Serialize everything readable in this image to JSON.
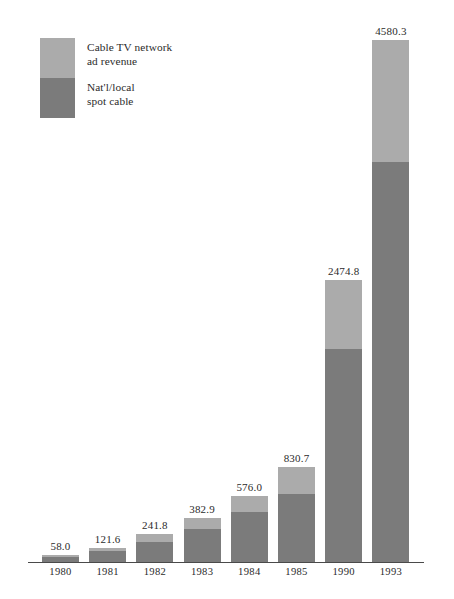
{
  "chart_data": {
    "type": "bar",
    "subtype": "stacked-bar",
    "title": "",
    "xlabel": "",
    "ylabel": "",
    "grid": false,
    "axis_visible": {
      "x": true,
      "y": false
    },
    "ylim": [
      0,
      4580.3
    ],
    "categories": [
      "1980",
      "1981",
      "1982",
      "1983",
      "1984",
      "1985",
      "1990",
      "1993"
    ],
    "series": [
      {
        "name": "Nat'l/local\nspot cable",
        "color": "#7b7b7b",
        "values": [
          47.0,
          95.0,
          180.0,
          288.0,
          435.0,
          600.0,
          1870.0,
          3510.0
        ]
      },
      {
        "name": "Cable TV network\nad revenue",
        "color": "#ababab",
        "values": [
          11.0,
          26.6,
          61.8,
          94.9,
          141.0,
          230.7,
          604.8,
          1070.3
        ]
      }
    ],
    "totals": [
      58.0,
      121.6,
      241.8,
      382.9,
      576.0,
      830.7,
      2474.8,
      4580.3
    ],
    "data_labels": [
      "58.0",
      "121.6",
      "241.8",
      "382.9",
      "576.0",
      "830.7",
      "2474.8",
      "4580.3"
    ],
    "legend": {
      "position": "top-left",
      "entries": [
        {
          "label": "Cable TV network\nad revenue",
          "color": "#ababab"
        },
        {
          "label": "Nat'l/local\nspot cable",
          "color": "#7b7b7b"
        }
      ]
    }
  },
  "legend": {
    "network_label": "Cable TV network\nad revenue",
    "spot_label": "Nat'l/local\nspot cable"
  },
  "colors": {
    "light_gray": "#ababab",
    "dark_gray": "#7b7b7b",
    "axis": "#4a4a4a",
    "text": "#2b2b2b",
    "background": "#ffffff"
  }
}
